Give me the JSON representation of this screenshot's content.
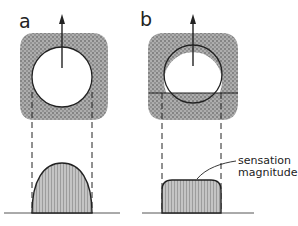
{
  "figure": {
    "panels": [
      {
        "label": "a",
        "description": "circular receptive field centered inside stippled surround; response profile is a rounded dome",
        "response_shape": "dome"
      },
      {
        "label": "b",
        "description": "circular receptive field bisected by horizontal line; response profile is a flat plateau",
        "response_shape": "plateau"
      }
    ],
    "annotation": {
      "line1": "sensation",
      "line2": "magnitude"
    },
    "colors": {
      "ink": "#222222",
      "stipple": "#8a8a8a",
      "fill": "#bdbdbd",
      "background": "#ffffff"
    }
  }
}
